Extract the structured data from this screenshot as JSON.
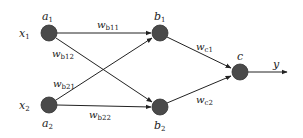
{
  "diagram": {
    "type": "neural-network",
    "colors": {
      "node": "#4a4a4a",
      "edge": "#222222",
      "background": "#ffffff"
    },
    "nodes": [
      {
        "id": "a1",
        "label": "a",
        "sub": "1",
        "x": 49,
        "y": 33
      },
      {
        "id": "a2",
        "label": "a",
        "sub": "2",
        "x": 49,
        "y": 105
      },
      {
        "id": "b1",
        "label": "b",
        "sub": "1",
        "x": 160,
        "y": 33
      },
      {
        "id": "b2",
        "label": "b",
        "sub": "2",
        "x": 160,
        "y": 107
      },
      {
        "id": "c",
        "label": "c",
        "sub": "",
        "x": 240,
        "y": 72
      }
    ],
    "inputs": [
      {
        "id": "x1",
        "label": "x",
        "sub": "1"
      },
      {
        "id": "x2",
        "label": "x",
        "sub": "2"
      }
    ],
    "output": {
      "id": "y",
      "label": "y"
    },
    "edges": [
      {
        "from": "a1",
        "to": "b1",
        "label": "w",
        "sub": "b11"
      },
      {
        "from": "a1",
        "to": "b2",
        "label": "w",
        "sub": "b12"
      },
      {
        "from": "a2",
        "to": "b1",
        "label": "w",
        "sub": "b21"
      },
      {
        "from": "a2",
        "to": "b2",
        "label": "w",
        "sub": "b22"
      },
      {
        "from": "b1",
        "to": "c",
        "label": "w",
        "sub": "c1"
      },
      {
        "from": "b2",
        "to": "c",
        "label": "w",
        "sub": "c2"
      },
      {
        "from": "c",
        "to": "y",
        "label": "",
        "sub": ""
      }
    ]
  }
}
